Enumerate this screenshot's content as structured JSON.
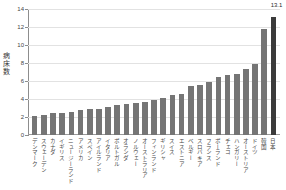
{
  "title": "",
  "chart_data": {
    "type": "bar",
    "title": "",
    "xlabel": "",
    "ylabel": "病床数",
    "ylim": [
      0,
      14
    ],
    "yticks": [
      0,
      2,
      4,
      6,
      8,
      10,
      12,
      14
    ],
    "grid": true,
    "legend": false,
    "categories": [
      "デンマーク",
      "スウェーデン",
      "カナダ",
      "イギリス",
      "ニュージーランド",
      "アメリカ",
      "スペイン",
      "アイルランド",
      "イタリア",
      "ポルトガル",
      "オランダ",
      "ノルウェー",
      "オーストラリア",
      "フィンランド",
      "ギリシャ",
      "スイス",
      "エストニア",
      "ベルギー",
      "スロバキア",
      "フランス",
      "ポーランド",
      "チェコ",
      "ハンガリー",
      "オーストリア",
      "ドイツ",
      "韓国",
      "日本"
    ],
    "values": [
      2.15,
      2.25,
      2.5,
      2.5,
      2.6,
      2.75,
      2.9,
      2.9,
      3.1,
      3.3,
      3.5,
      3.6,
      3.7,
      3.9,
      4.1,
      4.4,
      4.6,
      5.5,
      5.6,
      5.9,
      6.5,
      6.7,
      6.8,
      7.3,
      7.9,
      11.8,
      13.1
    ],
    "value_labels": [
      "",
      "",
      "",
      "",
      "",
      "",
      "",
      "",
      "",
      "",
      "",
      "",
      "",
      "",
      "",
      "",
      "",
      "",
      "",
      "",
      "",
      "",
      "",
      "",
      "",
      "",
      "13.1"
    ],
    "highlight_index": 26,
    "colors": {
      "bar": "#757575",
      "highlight_bar": "#3b3b3b",
      "grid": "#e2e2e2",
      "axis": "#8d8d8d",
      "text": "#3a3a3a"
    }
  }
}
